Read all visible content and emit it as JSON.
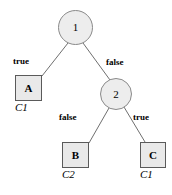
{
  "diagram": {
    "type": "decision-tree",
    "colors": {
      "background": "#ffffff",
      "node_fill": "#ededed",
      "node_stroke": "#8a8a8a",
      "box_fill": "#e9e9e9",
      "box_stroke": "#5a5a5a",
      "edge_stroke": "#6f6f6f",
      "text": "#000000"
    },
    "internal_nodes": [
      {
        "id": "node-1",
        "label": "1",
        "cx": 75.5,
        "cy": 27.5,
        "r": 17.5
      },
      {
        "id": "node-2",
        "label": "2",
        "cx": 116,
        "cy": 94,
        "r": 16
      }
    ],
    "leaf_nodes": [
      {
        "id": "leaf-a",
        "label": "A",
        "class_label": "C1",
        "x": 15,
        "y": 75,
        "w": 27,
        "h": 26
      },
      {
        "id": "leaf-b",
        "label": "B",
        "class_label": "C2",
        "x": 62,
        "y": 142,
        "w": 27,
        "h": 26
      },
      {
        "id": "leaf-c",
        "label": "C",
        "class_label": "C1",
        "x": 140,
        "y": 142,
        "w": 26,
        "h": 26
      }
    ],
    "edges": [
      {
        "id": "edge-1-a",
        "from": "node-1",
        "to": "leaf-a",
        "label": "true",
        "x1": 68,
        "y1": 43,
        "x2": 42,
        "y2": 76
      },
      {
        "id": "edge-1-2",
        "from": "node-1",
        "to": "node-2",
        "label": "false",
        "x1": 83,
        "y1": 43,
        "x2": 110,
        "y2": 80
      },
      {
        "id": "edge-2-b",
        "from": "node-2",
        "to": "leaf-b",
        "label": "false",
        "x1": 109,
        "y1": 108,
        "x2": 89,
        "y2": 143
      },
      {
        "id": "edge-2-c",
        "from": "node-2",
        "to": "leaf-c",
        "label": "true",
        "x1": 124,
        "y1": 107,
        "x2": 145,
        "y2": 142
      }
    ],
    "edge_labels": [
      {
        "id": "label-true-top",
        "text": "true",
        "x": 13,
        "y": 57
      },
      {
        "id": "label-false-top",
        "text": "false",
        "x": 106,
        "y": 58
      },
      {
        "id": "label-false-bottom",
        "text": "false",
        "x": 59,
        "y": 113
      },
      {
        "id": "label-true-bottom",
        "text": "true",
        "x": 133,
        "y": 113
      }
    ],
    "class_labels": [
      {
        "id": "class-a",
        "text": "C1",
        "x": 15,
        "y": 102
      },
      {
        "id": "class-b",
        "text": "C2",
        "x": 62,
        "y": 169
      },
      {
        "id": "class-c",
        "text": "C1",
        "x": 140,
        "y": 169
      }
    ]
  }
}
